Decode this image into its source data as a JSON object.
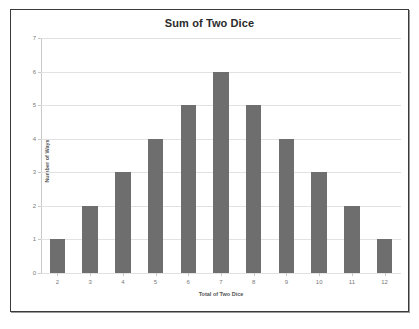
{
  "chart_data": {
    "type": "bar",
    "title": "Sum of Two Dice",
    "xlabel": "Total of Two Dice",
    "ylabel": "Number of Ways",
    "categories": [
      "2",
      "3",
      "4",
      "5",
      "6",
      "7",
      "8",
      "9",
      "10",
      "11",
      "12"
    ],
    "values": [
      1,
      2,
      3,
      4,
      5,
      6,
      5,
      4,
      3,
      2,
      1
    ],
    "ylim": [
      0,
      7
    ],
    "yticks": [
      "0",
      "1",
      "2",
      "3",
      "4",
      "5",
      "6",
      "7"
    ],
    "grid": true,
    "legend": "none",
    "bar_color": "#6e6e6e",
    "gridline_color": "#e2e2e2",
    "axis_color": "#c9c9c9",
    "border_color": "#3a3a3a",
    "background": "#ffffff"
  }
}
